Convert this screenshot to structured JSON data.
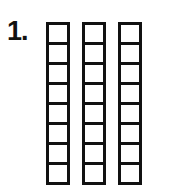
{
  "problem": {
    "number_label": "1."
  },
  "figure": {
    "type": "base-ten-blocks",
    "rods": [
      {
        "name": "tens-rod-1",
        "left": 46,
        "cells": 10
      },
      {
        "name": "tens-rod-2",
        "left": 82,
        "cells": 10
      },
      {
        "name": "tens-rod-3",
        "left": 118,
        "cells": 10
      }
    ],
    "line_color": "#111111"
  }
}
